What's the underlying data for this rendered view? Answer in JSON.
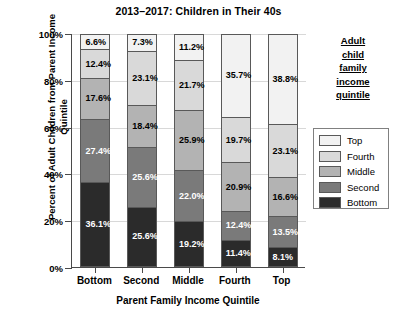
{
  "chart_data": {
    "type": "bar",
    "subtype": "stacked-bar-100-percent",
    "title": "2013–2017: Children in Their 40s",
    "xlabel": "Parent Family Income Quintile",
    "ylabel": "Percent of Adult Children from Parent Income Quintile",
    "categories": [
      "Bottom",
      "Second",
      "Middle",
      "Fourth",
      "Top"
    ],
    "ylim": [
      0,
      100
    ],
    "yticks": [
      "0%",
      "20%",
      "40%",
      "60%",
      "80%",
      "100%"
    ],
    "ytick_values": [
      0,
      20,
      40,
      60,
      80,
      100
    ],
    "grid": true,
    "legend_position": "right",
    "legend_title": "Adult child family income quintile",
    "legend_title_lines": [
      "Adult",
      "child",
      "family",
      "income",
      "quintile"
    ],
    "stack_order_bottom_to_top": [
      "Bottom",
      "Second",
      "Middle",
      "Fourth",
      "Top"
    ],
    "series": [
      {
        "name": "Top",
        "color": "#f2f2f2",
        "values": [
          6.6,
          7.3,
          11.2,
          35.7,
          38.8
        ],
        "labels": [
          "6.6%",
          "7.3%",
          "11.2%",
          "35.7%",
          "38.8%"
        ]
      },
      {
        "name": "Fourth",
        "color": "#d9d9d9",
        "values": [
          12.4,
          23.1,
          21.7,
          19.7,
          23.1
        ],
        "labels": [
          "12.4%",
          "23.1%",
          "21.7%",
          "19.7%",
          "23.1%"
        ]
      },
      {
        "name": "Middle",
        "color": "#b3b3b3",
        "values": [
          17.6,
          18.4,
          25.9,
          20.9,
          16.6
        ],
        "labels": [
          "17.6%",
          "18.4%",
          "25.9%",
          "20.9%",
          "16.6%"
        ]
      },
      {
        "name": "Second",
        "color": "#7a7a7a",
        "values": [
          27.4,
          25.6,
          22.0,
          12.4,
          13.5
        ],
        "labels": [
          "27.4%",
          "25.6%",
          "22.0%",
          "12.4%",
          "13.5%"
        ]
      },
      {
        "name": "Bottom",
        "color": "#2b2b2b",
        "values": [
          36.1,
          25.6,
          19.2,
          11.4,
          8.1
        ],
        "labels": [
          "36.1%",
          "25.6%",
          "19.2%",
          "11.4%",
          "8.1%"
        ]
      }
    ],
    "label_text_colors": {
      "Top": "#000000",
      "Fourth": "#000000",
      "Middle": "#000000",
      "Second": "#ffffff",
      "Bottom": "#ffffff"
    }
  },
  "legend": {
    "items": [
      {
        "label": "Top",
        "color": "#f2f2f2"
      },
      {
        "label": "Fourth",
        "color": "#d9d9d9"
      },
      {
        "label": "Middle",
        "color": "#b3b3b3"
      },
      {
        "label": "Second",
        "color": "#7a7a7a"
      },
      {
        "label": "Bottom",
        "color": "#2b2b2b"
      }
    ]
  }
}
